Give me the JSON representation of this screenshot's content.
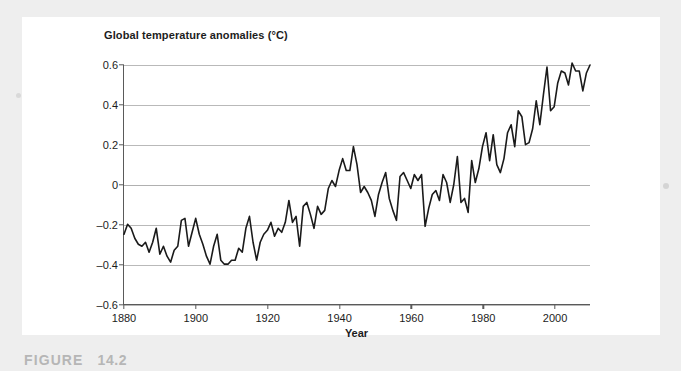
{
  "figure": {
    "caption_label": "FIGURE",
    "caption_number": "14.2"
  },
  "chart_data": {
    "type": "line",
    "title": "Global temperature anomalies (°C)",
    "xlabel": "Year",
    "ylabel": "",
    "xlim": [
      1880,
      2010
    ],
    "ylim": [
      -0.6,
      0.6
    ],
    "grid": true,
    "legend": "none",
    "xticks": [
      1880,
      1900,
      1920,
      1940,
      1960,
      1980,
      2000
    ],
    "xtick_labels": [
      "1880",
      "1900",
      "1920",
      "1940",
      "1960",
      "1980",
      "2000"
    ],
    "yticks": [
      0.6,
      0.4,
      0.2,
      0,
      -0.2,
      -0.4,
      -0.6
    ],
    "ytick_labels": [
      "0.6",
      "0.4",
      "0.2",
      "0",
      "–0.2",
      "–0.4",
      "–0.6"
    ],
    "series": [
      {
        "name": "Global temperature anomaly",
        "color": "#1a1a1a",
        "x": [
          1880,
          1881,
          1882,
          1883,
          1884,
          1885,
          1886,
          1887,
          1888,
          1889,
          1890,
          1891,
          1892,
          1893,
          1894,
          1895,
          1896,
          1897,
          1898,
          1899,
          1900,
          1901,
          1902,
          1903,
          1904,
          1905,
          1906,
          1907,
          1908,
          1909,
          1910,
          1911,
          1912,
          1913,
          1914,
          1915,
          1916,
          1917,
          1918,
          1919,
          1920,
          1921,
          1922,
          1923,
          1924,
          1925,
          1926,
          1927,
          1928,
          1929,
          1930,
          1931,
          1932,
          1933,
          1934,
          1935,
          1936,
          1937,
          1938,
          1939,
          1940,
          1941,
          1942,
          1943,
          1944,
          1945,
          1946,
          1947,
          1948,
          1949,
          1950,
          1951,
          1952,
          1953,
          1954,
          1955,
          1956,
          1957,
          1958,
          1959,
          1960,
          1961,
          1962,
          1963,
          1964,
          1965,
          1966,
          1967,
          1968,
          1969,
          1970,
          1971,
          1972,
          1973,
          1974,
          1975,
          1976,
          1977,
          1978,
          1979,
          1980,
          1981,
          1982,
          1983,
          1984,
          1985,
          1986,
          1987,
          1988,
          1989,
          1990,
          1991,
          1992,
          1993,
          1994,
          1995,
          1996,
          1997,
          1998,
          1999,
          2000,
          2001,
          2002,
          2003,
          2004,
          2005,
          2006,
          2007,
          2008,
          2009,
          2010
        ],
        "values": [
          -0.25,
          -0.2,
          -0.22,
          -0.27,
          -0.3,
          -0.31,
          -0.29,
          -0.34,
          -0.29,
          -0.22,
          -0.35,
          -0.31,
          -0.36,
          -0.39,
          -0.33,
          -0.31,
          -0.18,
          -0.17,
          -0.31,
          -0.24,
          -0.17,
          -0.25,
          -0.3,
          -0.36,
          -0.4,
          -0.31,
          -0.25,
          -0.38,
          -0.4,
          -0.4,
          -0.38,
          -0.38,
          -0.32,
          -0.34,
          -0.22,
          -0.16,
          -0.29,
          -0.38,
          -0.29,
          -0.25,
          -0.23,
          -0.19,
          -0.26,
          -0.22,
          -0.24,
          -0.19,
          -0.08,
          -0.19,
          -0.16,
          -0.31,
          -0.11,
          -0.09,
          -0.15,
          -0.22,
          -0.11,
          -0.15,
          -0.13,
          -0.02,
          0.02,
          -0.01,
          0.07,
          0.13,
          0.07,
          0.07,
          0.19,
          0.1,
          -0.04,
          -0.01,
          -0.04,
          -0.08,
          -0.16,
          -0.05,
          0.01,
          0.06,
          -0.07,
          -0.13,
          -0.18,
          0.04,
          0.06,
          0.02,
          -0.02,
          0.05,
          0.02,
          0.05,
          -0.21,
          -0.12,
          -0.05,
          -0.03,
          -0.08,
          0.05,
          0.01,
          -0.09,
          0.0,
          0.14,
          -0.09,
          -0.07,
          -0.14,
          0.12,
          0.01,
          0.08,
          0.19,
          0.26,
          0.12,
          0.25,
          0.1,
          0.06,
          0.13,
          0.26,
          0.3,
          0.19,
          0.37,
          0.34,
          0.2,
          0.21,
          0.28,
          0.42,
          0.3,
          0.45,
          0.59,
          0.37,
          0.39,
          0.51,
          0.57,
          0.56,
          0.5,
          0.61,
          0.57,
          0.57,
          0.47,
          0.56,
          0.6
        ]
      }
    ]
  }
}
